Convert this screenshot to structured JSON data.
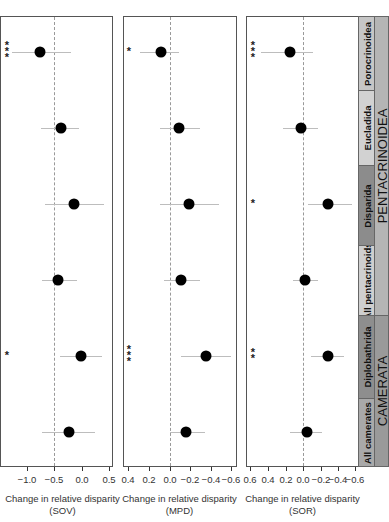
{
  "chart_data": {
    "type": "scatter",
    "subtype": "forest-plot (point estimate with confidence interval), three panels",
    "categories": [
      "Porocrinoidea",
      "Eucladida",
      "Disparida",
      "All pentacrinoids",
      "Diplobathrida",
      "All camerates"
    ],
    "groups": [
      {
        "name": "PENTACRINOIDEA",
        "members": [
          "Porocrinoidea",
          "Eucladida",
          "Disparida",
          "All pentacrinoids"
        ]
      },
      {
        "name": "CAMERATA",
        "members": [
          "Diplobathrida",
          "All camerates"
        ]
      }
    ],
    "panels": [
      {
        "name": "SOV",
        "xlabel": "Change in relative disparity\n(SOV)",
        "xticks": [
          "-1.0",
          "-0.5",
          "0.0",
          "0.5"
        ],
        "xlim": [
          -1.25,
          0.55
        ],
        "axis_reversed": false,
        "reference_line": -0.5,
        "values": [
          -0.76,
          -0.38,
          -0.15,
          -0.44,
          -0.01,
          -0.23
        ],
        "ci_low": [
          -1.28,
          -0.75,
          -0.68,
          -0.73,
          -0.4,
          -0.73
        ],
        "ci_high": [
          -0.2,
          -0.05,
          0.4,
          -0.09,
          0.36,
          0.24
        ],
        "significance": [
          "***",
          "",
          "",
          "",
          "*",
          ""
        ]
      },
      {
        "name": "MPD",
        "xlabel": "Change in relative disparity\n(MPD)",
        "xticks": [
          "0.4",
          "0.2",
          "0.0",
          "-0.2",
          "-0.4",
          "-0.6"
        ],
        "xlim": [
          0.45,
          -0.63
        ],
        "axis_reversed": true,
        "reference_line": 0.0,
        "values": [
          0.09,
          -0.09,
          -0.18,
          -0.11,
          -0.35,
          -0.15
        ],
        "ci_low": [
          0.29,
          0.1,
          0.1,
          0.06,
          -0.11,
          0.0
        ],
        "ci_high": [
          -0.09,
          -0.29,
          -0.47,
          -0.29,
          -0.59,
          -0.34
        ],
        "significance": [
          "*",
          "",
          "",
          "",
          "***",
          ""
        ]
      },
      {
        "name": "SOR",
        "xlabel": "Change in relative disparity\n(SOR)",
        "xticks": [
          "0.6",
          "0.4",
          "0.2",
          "0.0",
          "-0.2",
          "-0.4",
          "-0.6"
        ],
        "xlim": [
          0.65,
          -0.63
        ],
        "axis_reversed": true,
        "reference_line": 0.0,
        "values": [
          0.15,
          0.02,
          -0.29,
          -0.02,
          -0.29,
          -0.05
        ],
        "ci_low": [
          0.48,
          0.23,
          -0.06,
          0.11,
          -0.09,
          0.15
        ],
        "ci_high": [
          -0.11,
          -0.17,
          -0.56,
          -0.17,
          -0.47,
          -0.22
        ],
        "significance": [
          "***",
          "",
          "*",
          "",
          "**",
          ""
        ]
      }
    ],
    "grid": false,
    "legend": "none (category labels in shaded sidebar on the right)"
  },
  "panels": [
    {
      "xlabel_line1": "Change in relative disparity",
      "xlabel_line2": "(SOV)",
      "ticks": [
        "−1.0",
        "−0.5",
        "0.0",
        "0.5"
      ]
    },
    {
      "xlabel_line1": "Change in relative disparity",
      "xlabel_line2": "(MPD)",
      "ticks": [
        "0.4",
        "0.2",
        "0.0",
        "−0.2",
        "−0.4",
        "−0.6"
      ]
    },
    {
      "xlabel_line1": "Change in relative disparity",
      "xlabel_line2": "(SOR)",
      "ticks": [
        "0.6",
        "0.4",
        "0.2",
        "0.0",
        "−0.2",
        "−0.4",
        "−0.6"
      ]
    }
  ],
  "sidebar": {
    "clades": [
      "Porocrinoidea",
      "Eucladida",
      "Disparida",
      "All pentacrinoids",
      "Diplobathrida",
      "All camerates"
    ],
    "groups": [
      "PENTACRINOIDEA",
      "CAMERATA"
    ],
    "colors": {
      "Porocrinoidea": "#c6c6c6",
      "Eucladida": "#d2d2d2",
      "Disparida": "#8c8c8c",
      "All pentacrinoids": "#cfcfcf",
      "Diplobathrida": "#8e8e8e",
      "All camerates": "#a9a9a9",
      "PENTACRINOIDEA": "#b5b5b5",
      "CAMERATA": "#9a9a9a"
    }
  }
}
